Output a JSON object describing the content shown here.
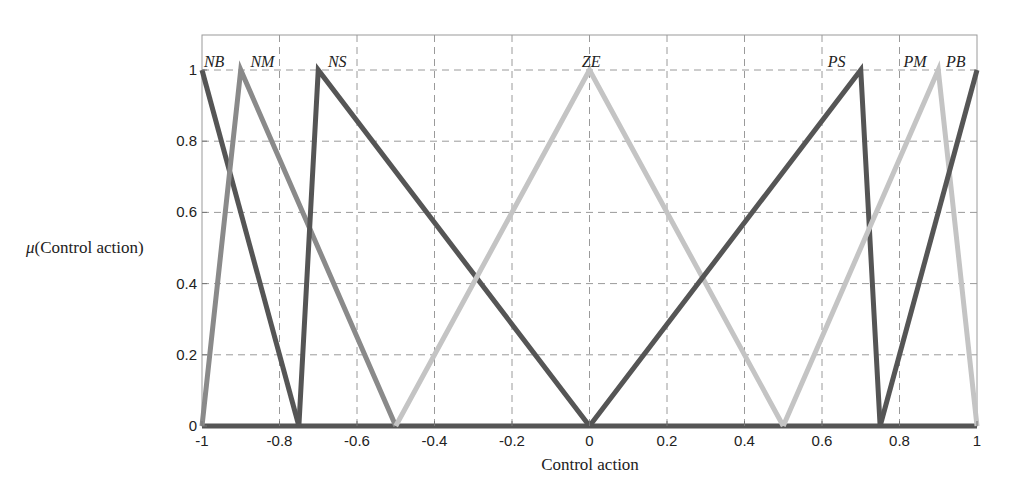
{
  "chart_data": {
    "type": "line",
    "title": "",
    "xlabel": "Control action",
    "ylabel_prefix": "μ",
    "ylabel": "(Control action)",
    "xlim": [
      -1,
      1
    ],
    "ylim": [
      0,
      1.1
    ],
    "grid": true,
    "legend": "inline labels at peaks",
    "x_ticks": [
      -1,
      -0.8,
      -0.6,
      -0.4,
      -0.2,
      0,
      0.2,
      0.4,
      0.6,
      0.8,
      1
    ],
    "x_tick_labels": [
      "-1",
      "-0.8",
      "-0.6",
      "-0.4",
      "-0.2",
      "0",
      "0.2",
      "0.4",
      "0.6",
      "0.8",
      "1"
    ],
    "y_ticks": [
      0,
      0.2,
      0.4,
      0.6,
      0.8,
      1
    ],
    "y_tick_labels": [
      "0",
      "0.2",
      "0.4",
      "0.6",
      "0.8",
      "1"
    ],
    "series": [
      {
        "name": "NB",
        "color": "#555555",
        "points": [
          [
            -1,
            1
          ],
          [
            -0.75,
            0
          ]
        ],
        "label_x": -0.995
      },
      {
        "name": "NM",
        "color": "#8a8a8a",
        "points": [
          [
            -1,
            0
          ],
          [
            -0.9,
            1
          ],
          [
            -0.5,
            0
          ]
        ],
        "label_x": -0.875
      },
      {
        "name": "NS",
        "color": "#555555",
        "points": [
          [
            -0.75,
            0
          ],
          [
            -0.7,
            1
          ],
          [
            0,
            0
          ]
        ],
        "label_x": -0.675
      },
      {
        "name": "ZE",
        "color": "#c4c4c4",
        "points": [
          [
            -0.5,
            0
          ],
          [
            0,
            1
          ],
          [
            0.5,
            0
          ]
        ],
        "label_x": -0.02
      },
      {
        "name": "PS",
        "color": "#555555",
        "points": [
          [
            0,
            0
          ],
          [
            0.7,
            1
          ],
          [
            0.75,
            0
          ]
        ],
        "label_x": 0.615
      },
      {
        "name": "PM",
        "color": "#c4c4c4",
        "points": [
          [
            0.5,
            0
          ],
          [
            0.9,
            1
          ],
          [
            1,
            0
          ]
        ],
        "label_x": 0.81
      },
      {
        "name": "PB",
        "color": "#555555",
        "points": [
          [
            0.75,
            0
          ],
          [
            1,
            1
          ]
        ],
        "label_x": 0.92
      }
    ],
    "baseline": {
      "color": "#555555",
      "points": [
        [
          -1,
          0
        ],
        [
          1,
          0
        ]
      ]
    }
  }
}
